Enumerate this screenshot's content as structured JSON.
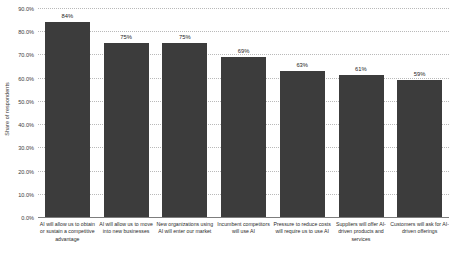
{
  "chart_data": {
    "type": "bar",
    "title": "",
    "xlabel": "",
    "ylabel": "Share of respondents",
    "ylim": [
      0,
      90
    ],
    "grid": true,
    "legend": "none",
    "bar_color": "#3c3c3c",
    "categories": [
      "AI will allow us to obtain or sustain a competitive advantage",
      "AI will allow us to move into new businesses",
      "New organizations using AI will enter our market",
      "Incumbent competitors will use AI",
      "Pressure to reduce costs will require us to use AI",
      "Suppliers will offer AI-driven products and services",
      "Customers will ask for AI-driven offerings"
    ],
    "values": [
      84,
      75,
      75,
      69,
      63,
      61,
      59
    ],
    "value_labels": [
      "84%",
      "75%",
      "75%",
      "69%",
      "63%",
      "61%",
      "59%"
    ],
    "y_ticks": [
      "0.0%",
      "10.0%",
      "20.0%",
      "30.0%",
      "40.0%",
      "50.0%",
      "60.0%",
      "70.0%",
      "80.0%",
      "90.0%"
    ],
    "y_tick_values": [
      0,
      10,
      20,
      30,
      40,
      50,
      60,
      70,
      80,
      90
    ]
  }
}
